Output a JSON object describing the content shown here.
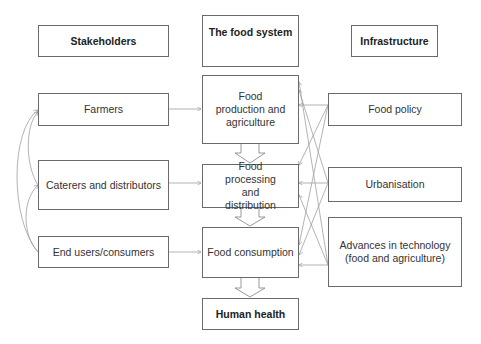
{
  "headers": {
    "stakeholders": "Stakeholders",
    "food_system": "The food system",
    "infrastructure": "Infrastructure"
  },
  "stakeholders": [
    "Farmers",
    "Caterers and distributors",
    "End users/consumers"
  ],
  "food_system": [
    "Food production and agriculture",
    "Food processing and distribution",
    "Food consumption"
  ],
  "outcome": "Human health",
  "infrastructure": [
    "Food policy",
    "Urbanisation",
    "Advances in technology (food and agriculture)"
  ],
  "colors": {
    "border": "#6a6a6a",
    "arrow": "#9a9a9a",
    "text": "#333333"
  }
}
